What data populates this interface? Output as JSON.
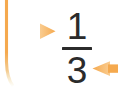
{
  "canvas": {
    "width": 118,
    "height": 97,
    "background": "#ffffff"
  },
  "fraction": {
    "numerator": "1",
    "denominator": "3",
    "bar": "—",
    "value_label": "1/3",
    "text_color": "#2b2b2b"
  },
  "connectors": {
    "accent_color": "#f5a94e",
    "accent_color_light": "#f9c98a",
    "left_branch": {
      "name": "branch-line",
      "description": "vertical spine with horizontal stem"
    },
    "arrow_right": {
      "name": "arrow-right",
      "direction": "right"
    },
    "arrow_left": {
      "name": "arrow-left",
      "direction": "left"
    }
  }
}
